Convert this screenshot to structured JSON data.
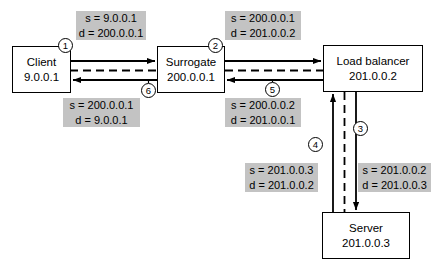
{
  "diagram": {
    "background": "#ffffff",
    "label_fill": "#c3c3c3",
    "stroke": "#000000"
  },
  "nodes": [
    {
      "id": "client",
      "name": "Client",
      "address": "9.0.0.1"
    },
    {
      "id": "surrogate",
      "name": "Surrogate",
      "address": "200.0.0.1"
    },
    {
      "id": "lb",
      "name": "Load balancer",
      "address": "201.0.0.2"
    },
    {
      "id": "server",
      "name": "Server",
      "address": "201.0.0.3"
    }
  ],
  "packet_labels": [
    {
      "id": "label_1",
      "source": "s = 9.0.0.1",
      "dest": "d = 200.0.0.1"
    },
    {
      "id": "label_2",
      "source": "s = 200.0.0.1",
      "dest": "d = 201.0.0.2"
    },
    {
      "id": "label_3",
      "source": "s = 201.0.0.2",
      "dest": "d = 201.0.0.3"
    },
    {
      "id": "label_4",
      "source": "s = 201.0.0.3",
      "dest": "d = 201.0.0.2"
    },
    {
      "id": "label_5",
      "source": "s = 200.0.0.2",
      "dest": "d = 201.0.0.1"
    },
    {
      "id": "label_6",
      "source": "s = 200.0.0.1",
      "dest": "d = 9.0.0.1"
    }
  ],
  "steps": [
    {
      "id": "step_1",
      "number": "1"
    },
    {
      "id": "step_2",
      "number": "2"
    },
    {
      "id": "step_3",
      "number": "3"
    },
    {
      "id": "step_4",
      "number": "4"
    },
    {
      "id": "step_5",
      "number": "5"
    },
    {
      "id": "step_6",
      "number": "6"
    }
  ]
}
